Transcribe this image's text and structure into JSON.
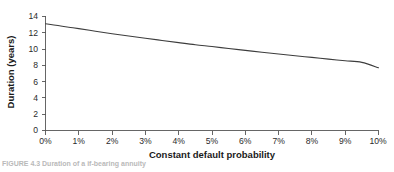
{
  "figure": {
    "caption_partial": "FIGURE 4.3  Duration of a if-bearing annuity",
    "background_color": "#ffffff",
    "line_color": "#3d3d3d",
    "axis_color": "#555555"
  },
  "chart_data": {
    "type": "line",
    "title": "",
    "subtitle": "",
    "xlabel": "Constant default probability",
    "ylabel": "Duration (years)",
    "xlim": [
      0,
      10
    ],
    "ylim": [
      0,
      14
    ],
    "xticks": [
      0,
      1,
      2,
      3,
      4,
      5,
      6,
      7,
      8,
      9,
      10
    ],
    "xtick_labels": [
      "0%",
      "1%",
      "2%",
      "3%",
      "4%",
      "5%",
      "6%",
      "7%",
      "8%",
      "9%",
      "10%"
    ],
    "yticks": [
      0,
      2,
      4,
      6,
      8,
      10,
      12,
      14
    ],
    "ytick_labels": [
      "0",
      "2",
      "4",
      "6",
      "8",
      "10",
      "12",
      "14"
    ],
    "grid": false,
    "legend": null,
    "legend_position": "none",
    "annotations": [],
    "series": [
      {
        "name": "Duration",
        "x": [
          0,
          0.25,
          0.5,
          0.75,
          1,
          1.5,
          2,
          2.5,
          3,
          3.5,
          4,
          4.5,
          5,
          5.5,
          6,
          6.5,
          7,
          7.5,
          8,
          8.5,
          9,
          9.5,
          10
        ],
        "values": [
          13.1,
          12.95,
          12.8,
          12.65,
          12.5,
          12.18,
          11.88,
          11.6,
          11.32,
          11.05,
          10.78,
          10.52,
          10.3,
          10.06,
          9.83,
          9.6,
          9.38,
          9.17,
          8.97,
          8.76,
          8.56,
          8.36,
          7.7
        ]
      }
    ]
  },
  "axis": {
    "x_title": "Constant default probability",
    "y_title": "Duration (years)"
  }
}
